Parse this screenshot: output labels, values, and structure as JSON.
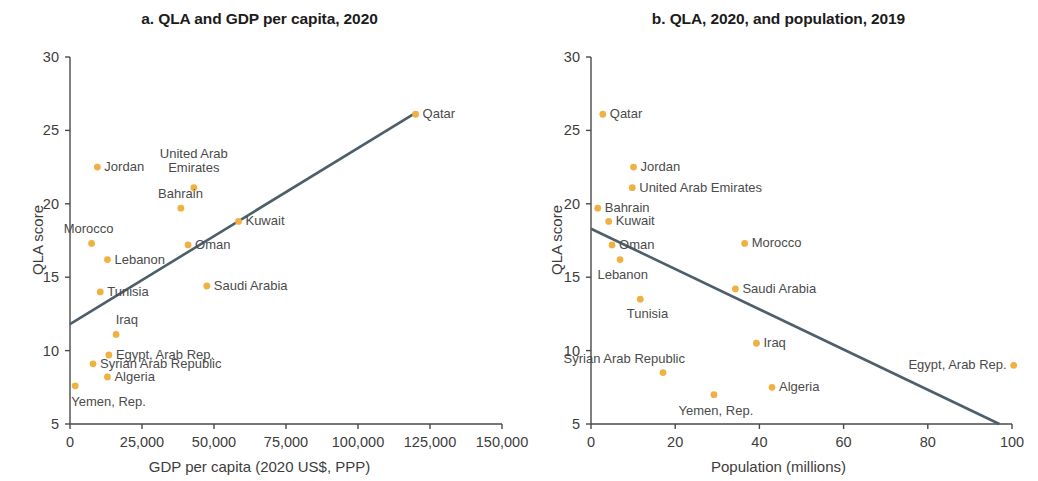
{
  "figure": {
    "dot_color": "#F0B143",
    "line_color": "#4C5F6B",
    "axis_color": "#4a4a4a",
    "text_color": "#3d3d3d"
  },
  "panels": [
    {
      "id": "a",
      "title": "a. QLA and GDP per capita, 2020",
      "xlabel": "GDP per capita (2020 US$, PPP)",
      "ylabel": "QLA score",
      "xticks": [
        "0",
        "25,000",
        "50,000",
        "75,000",
        "100,000",
        "125,000",
        "150,000"
      ],
      "yticks": [
        "5",
        "10",
        "15",
        "20",
        "25",
        "30"
      ]
    },
    {
      "id": "b",
      "title": "b. QLA, 2020, and population, 2019",
      "xlabel": "Population (millions)",
      "ylabel": "QLA score",
      "xticks": [
        "0",
        "20",
        "40",
        "60",
        "80",
        "100"
      ],
      "yticks": [
        "5",
        "10",
        "15",
        "20",
        "25",
        "30"
      ]
    }
  ],
  "chart_data": [
    {
      "type": "scatter",
      "panel": "a",
      "title": "a. QLA and GDP per capita, 2020",
      "xlabel": "GDP per capita (2020 US$, PPP)",
      "ylabel": "QLA score",
      "xlim": [
        0,
        150000
      ],
      "ylim": [
        5,
        30
      ],
      "xticks": [
        0,
        25000,
        50000,
        75000,
        100000,
        125000,
        150000
      ],
      "yticks": [
        5,
        10,
        15,
        20,
        25,
        30
      ],
      "grid": false,
      "legend": "none",
      "trendline": {
        "x": [
          0,
          120000
        ],
        "y": [
          11.8,
          26.2
        ]
      },
      "points": [
        {
          "label": "Qatar",
          "x": 120000,
          "y": 26.1,
          "lpos": "right"
        },
        {
          "label": "Jordan",
          "x": 9500,
          "y": 22.5,
          "lpos": "right"
        },
        {
          "label": "United Arab\nEmirates",
          "x": 43000,
          "y": 21.1,
          "lpos": "above"
        },
        {
          "label": "Bahrain",
          "x": 38500,
          "y": 19.7,
          "lpos": "above-left"
        },
        {
          "label": "Kuwait",
          "x": 58500,
          "y": 18.8,
          "lpos": "right"
        },
        {
          "label": "Morocco",
          "x": 7500,
          "y": 17.3,
          "lpos": "above-left"
        },
        {
          "label": "Oman",
          "x": 41000,
          "y": 17.2,
          "lpos": "right"
        },
        {
          "label": "Lebanon",
          "x": 13000,
          "y": 16.2,
          "lpos": "right"
        },
        {
          "label": "Saudi Arabia",
          "x": 47500,
          "y": 14.4,
          "lpos": "right"
        },
        {
          "label": "Tunisia",
          "x": 10500,
          "y": 14.0,
          "lpos": "right"
        },
        {
          "label": "Iraq",
          "x": 16000,
          "y": 11.1,
          "lpos": "above-left"
        },
        {
          "label": "Egypt, Arab Rep.",
          "x": 13500,
          "y": 9.7,
          "lpos": "right"
        },
        {
          "label": "Syrian Arab Republic",
          "x": 8000,
          "y": 9.1,
          "lpos": "right"
        },
        {
          "label": "Algeria",
          "x": 13000,
          "y": 8.2,
          "lpos": "right"
        },
        {
          "label": "Yemen, Rep.",
          "x": 1800,
          "y": 7.6,
          "lpos": "below-right"
        }
      ]
    },
    {
      "type": "scatter",
      "panel": "b",
      "title": "b. QLA, 2020, and population, 2019",
      "xlabel": "Population (millions)",
      "ylabel": "QLA score",
      "xlim": [
        0,
        100
      ],
      "ylim": [
        5,
        30
      ],
      "xticks": [
        0,
        20,
        40,
        60,
        80,
        100
      ],
      "yticks": [
        5,
        10,
        15,
        20,
        25,
        30
      ],
      "grid": false,
      "legend": "none",
      "trendline": {
        "x": [
          0,
          97
        ],
        "y": [
          18.3,
          5.0
        ]
      },
      "points": [
        {
          "label": "Qatar",
          "x": 2.8,
          "y": 26.1,
          "lpos": "right"
        },
        {
          "label": "Jordan",
          "x": 10.1,
          "y": 22.5,
          "lpos": "right"
        },
        {
          "label": "United Arab Emirates",
          "x": 9.8,
          "y": 21.1,
          "lpos": "right"
        },
        {
          "label": "Bahrain",
          "x": 1.6,
          "y": 19.7,
          "lpos": "right"
        },
        {
          "label": "Kuwait",
          "x": 4.2,
          "y": 18.8,
          "lpos": "right"
        },
        {
          "label": "Morocco",
          "x": 36.5,
          "y": 17.3,
          "lpos": "right"
        },
        {
          "label": "Oman",
          "x": 5.0,
          "y": 17.2,
          "lpos": "right"
        },
        {
          "label": "Lebanon",
          "x": 6.9,
          "y": 16.2,
          "lpos": "below-left"
        },
        {
          "label": "Saudi Arabia",
          "x": 34.3,
          "y": 14.2,
          "lpos": "right"
        },
        {
          "label": "Tunisia",
          "x": 11.7,
          "y": 13.5,
          "lpos": "below-left"
        },
        {
          "label": "Iraq",
          "x": 39.3,
          "y": 10.5,
          "lpos": "right"
        },
        {
          "label": "Egypt, Arab Rep.",
          "x": 100.4,
          "y": 9.0,
          "lpos": "left"
        },
        {
          "label": "Syrian Arab Republic",
          "x": 17.1,
          "y": 8.5,
          "lpos": "above-left"
        },
        {
          "label": "Algeria",
          "x": 43.0,
          "y": 7.5,
          "lpos": "right"
        },
        {
          "label": "Yemen, Rep.",
          "x": 29.2,
          "y": 7.0,
          "lpos": "below"
        }
      ]
    }
  ]
}
